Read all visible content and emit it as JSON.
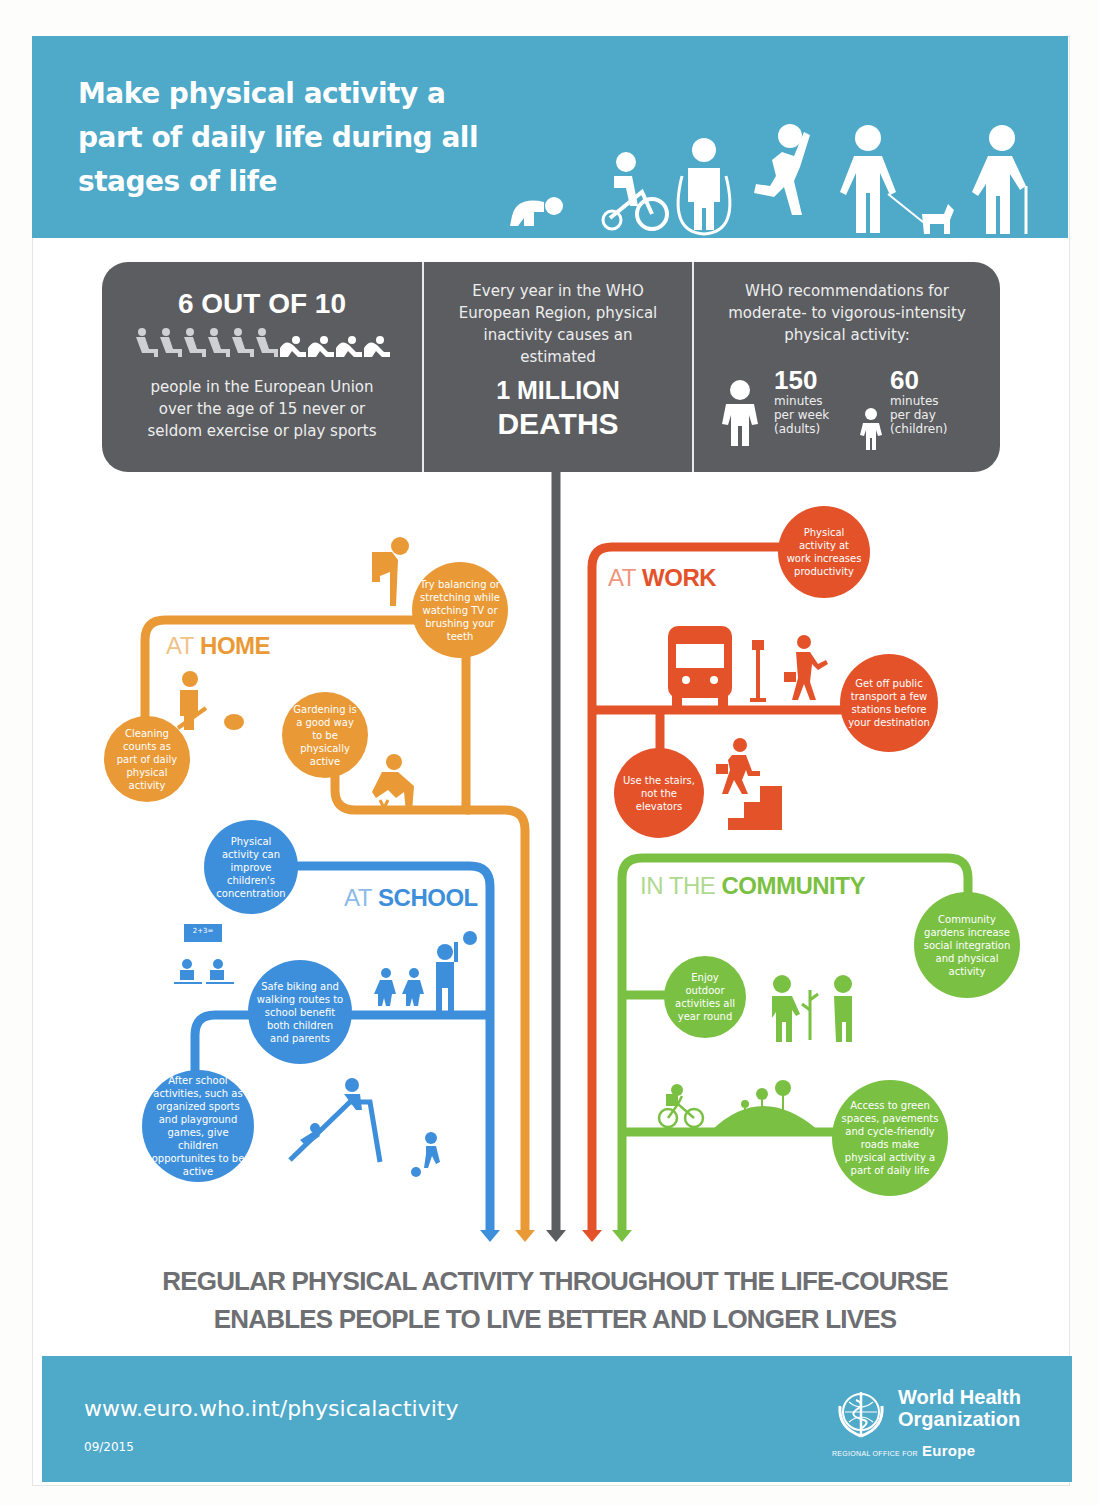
{
  "header": {
    "title": "Make physical activity a part of daily life during all stages of life",
    "life_stage_icons": [
      "crawling-baby-icon",
      "tricycle-child-icon",
      "jump-rope-child-icon",
      "running-person-icon",
      "dog-walking-adult-icon",
      "elderly-cane-icon"
    ]
  },
  "stats": {
    "inactive": {
      "headline": "6 OUT OF 10",
      "description": "people in the European Union over the age of 15 never or seldom exercise or play sports",
      "icons": {
        "sitting": 6,
        "active": 4
      }
    },
    "deaths": {
      "intro": "Every year in the WHO European Region, physical inactivity causes an estimated",
      "line1": "1 MILLION",
      "line2": "DEATHS"
    },
    "recommendations": {
      "intro": "WHO recommendations for moderate- to vigorous-intensity physical activity:",
      "adults": {
        "value": "150",
        "unit": "minutes",
        "period": "per week",
        "group": "(adults)"
      },
      "children": {
        "value": "60",
        "unit": "minutes",
        "period": "per day",
        "group": "(children)"
      }
    }
  },
  "sections": {
    "home": {
      "prefix": "AT",
      "title": "HOME",
      "color": "#e99a36",
      "bubbles": [
        "Try balancing or stretching while watching TV or brushing your teeth",
        "Cleaning counts as part of daily physical activity",
        "Gardening is a good way to be physically active"
      ]
    },
    "work": {
      "prefix": "AT",
      "title": "WORK",
      "color": "#e4522a",
      "bubbles": [
        "Physical activity at work increases productivity",
        "Get off public transport a few stations before your destination",
        "Use the stairs, not the elevators"
      ]
    },
    "school": {
      "prefix": "AT",
      "title": "SCHOOL",
      "color": "#3e8fdb",
      "blackboard": "2+3=",
      "bubbles": [
        "Physical activity can improve children's concentration",
        "Safe biking and walking routes to school benefit both children and parents",
        "After school activities, such as organized sports and playground games, give children opportunites to be active"
      ]
    },
    "community": {
      "prefix": "IN THE",
      "title": "COMMUNITY",
      "color": "#7ac143",
      "bubbles": [
        "Community gardens increase social integration and physical activity",
        "Enjoy outdoor activities all year round",
        "Access to green spaces, pavements and cycle-friendly roads make physical activity a part of daily life"
      ]
    }
  },
  "slogan": {
    "line1": "REGULAR PHYSICAL ACTIVITY THROUGHOUT THE LIFE-COURSE",
    "line2": "ENABLES PEOPLE TO LIVE BETTER AND LONGER LIVES"
  },
  "footer": {
    "url": "www.euro.who.int/physicalactivity",
    "date": "09/2015",
    "org_line1": "World Health",
    "org_line2": "Organization",
    "region_prefix": "REGIONAL OFFICE FOR",
    "region": "Europe"
  },
  "colors": {
    "header_blue": "#4fa9c9",
    "stats_gray": "#5b5d61",
    "home_orange": "#e99a36",
    "work_red": "#e4522a",
    "school_blue": "#3e8fdb",
    "community_green": "#7ac143",
    "slogan_gray": "#6d6f73"
  }
}
